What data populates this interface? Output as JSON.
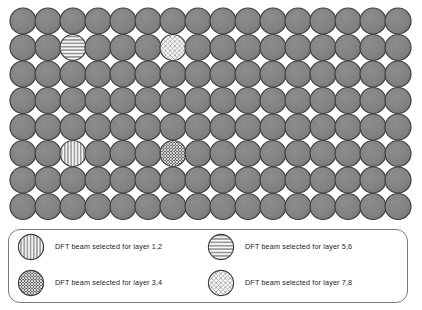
{
  "figure": {
    "title": "",
    "background_color": "#ffffff"
  },
  "grid": {
    "columns": 16,
    "rows": 8,
    "circle_diameter": 26,
    "spacing_x": 25,
    "spacing_y": 26.5,
    "origin_x": 10,
    "origin_y": 8,
    "default_fill": "#808080",
    "default_stroke": "#404040",
    "name": "beam-grid"
  },
  "patterns": {
    "plain": {
      "id": "plain",
      "label": "unselected beam",
      "fill": "#808080",
      "stroke": "#404040"
    },
    "vertical_stripes": {
      "id": "vertical-stripes",
      "label": "DFT beam selected for layer 1,2",
      "fill": "#f2f2f2",
      "line_color": "#8c8c8c",
      "stroke": "#404040"
    },
    "dark_crosshatch": {
      "id": "dark-crosshatch",
      "label": "DFT beam selected for layer 3,4",
      "fill": "#6e6e6e",
      "line_color": "#d8d8d8",
      "stroke": "#404040"
    },
    "horizontal_stripes": {
      "id": "horizontal-stripes",
      "label": "DFT beam selected for layer 5,6",
      "fill": "#9a9a9a",
      "line_color": "#ffffff",
      "stroke": "#404040"
    },
    "light_crosshatch": {
      "id": "light-crosshatch",
      "label": "DFT beam selected for layer 7,8",
      "fill": "#fafafa",
      "line_color": "#9a9a9a",
      "stroke": "#404040"
    }
  },
  "selected_cells": [
    {
      "row": 2,
      "col": 3,
      "pattern": "horizontal_stripes",
      "layers": "5,6"
    },
    {
      "row": 2,
      "col": 7,
      "pattern": "light_crosshatch",
      "layers": "7,8"
    },
    {
      "row": 6,
      "col": 3,
      "pattern": "vertical_stripes",
      "layers": "1,2"
    },
    {
      "row": 6,
      "col": 7,
      "pattern": "dark_crosshatch",
      "layers": "3,4"
    }
  ],
  "legend": {
    "border_color": "#7a7a7a",
    "entries": [
      {
        "swatch": "vertical_stripes",
        "label": "DFT beam selected for layer 1,2"
      },
      {
        "swatch": "horizontal_stripes",
        "label": "DFT beam selected for layer 5,6"
      },
      {
        "swatch": "dark_crosshatch",
        "label": "DFT beam selected for layer 3,4"
      },
      {
        "swatch": "light_crosshatch",
        "label": "DFT beam selected for layer 7,8"
      }
    ]
  }
}
